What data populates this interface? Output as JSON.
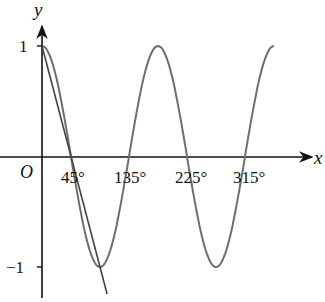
{
  "chart_data": {
    "type": "line",
    "title": "",
    "xlabel": "x",
    "ylabel": "y",
    "origin_label": "O",
    "x_ticks": [
      "45°",
      "135°",
      "225°",
      "315°"
    ],
    "x_tick_values_deg": [
      45,
      135,
      225,
      315
    ],
    "y_ticks": [
      "1",
      "−1"
    ],
    "y_tick_values": [
      1,
      -1
    ],
    "xlim_deg": [
      0,
      360
    ],
    "ylim": [
      -1,
      1
    ],
    "grid": false,
    "legend": null,
    "series": [
      {
        "name": "y = cos 2x",
        "kind": "curve",
        "x_deg": [
          0,
          45,
          90,
          135,
          180,
          225,
          270,
          315,
          360
        ],
        "y": [
          1,
          0,
          -1,
          0,
          1,
          0,
          -1,
          0,
          1
        ]
      },
      {
        "name": "line through (0°,1) and (90°,−1)",
        "kind": "straight line",
        "x_deg": [
          0,
          90
        ],
        "y": [
          1,
          -1
        ]
      }
    ],
    "colors": {
      "axes": "#111111",
      "curve": "#6e6e6e",
      "line": "#444444"
    }
  }
}
